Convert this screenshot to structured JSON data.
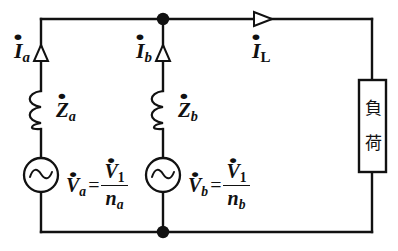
{
  "diagram": {
    "type": "electrical-schematic",
    "stroke_color": "#111111",
    "background_color": "#ffffff"
  },
  "labels": {
    "current_a": {
      "symbol": "I",
      "subscript": "a",
      "text": "İa"
    },
    "current_b": {
      "symbol": "I",
      "subscript": "b",
      "text": "İb"
    },
    "current_load": {
      "symbol": "I",
      "subscript": "L",
      "text": "İL"
    },
    "impedance_a": {
      "symbol": "Z",
      "subscript": "a",
      "text": "Ża"
    },
    "impedance_b": {
      "symbol": "Z",
      "subscript": "b",
      "text": "Żb"
    }
  },
  "equations": {
    "source_a": {
      "lhs_symbol": "V",
      "lhs_subscript": "a",
      "operator": "=",
      "numerator_symbol": "V",
      "numerator_subscript": "1",
      "denominator_symbol": "n",
      "denominator_subscript": "a",
      "text": "V̇a = V̇1 / na"
    },
    "source_b": {
      "lhs_symbol": "V",
      "lhs_subscript": "b",
      "operator": "=",
      "numerator_symbol": "V",
      "numerator_subscript": "1",
      "denominator_symbol": "n",
      "denominator_subscript": "b",
      "text": "V̇b = V̇1 / nb"
    }
  },
  "load": {
    "char_top": "負",
    "char_bottom": "荷",
    "text": "負荷"
  },
  "components": {
    "source_a_name": "ac-voltage-source-a",
    "source_b_name": "ac-voltage-source-b",
    "inductor_a_name": "inductor-za",
    "inductor_b_name": "inductor-zb",
    "load_name": "load-block"
  }
}
